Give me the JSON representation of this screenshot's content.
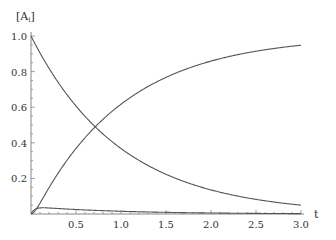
{
  "chart_data": {
    "type": "line",
    "title": "",
    "xlabel": "t",
    "ylabel": "[A_i]",
    "xlim": [
      0,
      3.0
    ],
    "ylim": [
      0,
      1.0
    ],
    "x_ticks": [
      "0.5",
      "1.0",
      "1.5",
      "2.0",
      "2.5",
      "3.0"
    ],
    "y_ticks": [
      "0.2",
      "0.4",
      "0.6",
      "0.8",
      "1.0"
    ],
    "grid": false,
    "legend": null,
    "x": [
      0,
      0.07,
      0.25,
      0.5,
      0.75,
      1.0,
      1.5,
      2.0,
      2.5,
      3.0
    ],
    "series": [
      {
        "name": "A (decaying)",
        "values": [
          1.0,
          0.93,
          0.78,
          0.61,
          0.47,
          0.37,
          0.22,
          0.14,
          0.08,
          0.05
        ]
      },
      {
        "name": "B (intermediate)",
        "values": [
          0.0,
          0.04,
          0.035,
          0.03,
          0.025,
          0.02,
          0.015,
          0.01,
          0.007,
          0.005
        ]
      },
      {
        "name": "C (product)",
        "values": [
          0.0,
          0.03,
          0.19,
          0.36,
          0.51,
          0.61,
          0.76,
          0.85,
          0.91,
          0.95
        ]
      }
    ],
    "line_color": "#555555"
  }
}
